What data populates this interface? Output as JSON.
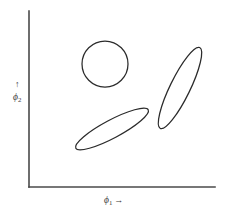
{
  "figure": {
    "background_color": "#ffffff",
    "axis_color": "#4a4a4a",
    "shape_stroke_color": "#2b2b2b",
    "x_axis": {
      "symbol": "ϕ",
      "subscript": "1",
      "arrow": "→",
      "label_full": "ϕ₁ →"
    },
    "y_axis": {
      "symbol": "ϕ",
      "subscript": "2",
      "arrow": "↑",
      "label_full": "↑ ϕ₂"
    }
  },
  "chart_data": {
    "type": "scatter",
    "title": "",
    "xlabel": "ϕ₁ →",
    "ylabel": "↑ ϕ₂",
    "grid": false,
    "legend": "none",
    "axis_style": "two-sided-L-frame",
    "xlim": [
      0,
      1
    ],
    "ylim": [
      0,
      1
    ],
    "shapes": [
      {
        "name": "isotropic-circle",
        "kind": "circle",
        "center_px": [
          105,
          64
        ],
        "center_norm": [
          0.41,
          0.66
        ],
        "radius_px": 23,
        "rx_px": 23,
        "ry_px": 23,
        "rotation_deg": 0,
        "eccentricity": 0.0,
        "filled": false
      },
      {
        "name": "shallow-tilted-ellipse",
        "kind": "ellipse",
        "center_px": [
          112,
          129
        ],
        "center_norm": [
          0.45,
          0.33
        ],
        "rx_px": 41,
        "ry_px": 9,
        "rotation_deg": -28,
        "eccentricity": 0.98,
        "filled": false
      },
      {
        "name": "steep-tilted-ellipse",
        "kind": "ellipse",
        "center_px": [
          180,
          88
        ],
        "center_norm": [
          0.81,
          0.53
        ],
        "rx_px": 45,
        "ry_px": 10,
        "rotation_deg": -64,
        "eccentricity": 0.98,
        "filled": false
      }
    ],
    "axes_geometry_px": {
      "origin": [
        29,
        187
      ],
      "y_axis_top": [
        29,
        11
      ],
      "x_axis_right": [
        215,
        187
      ]
    }
  }
}
